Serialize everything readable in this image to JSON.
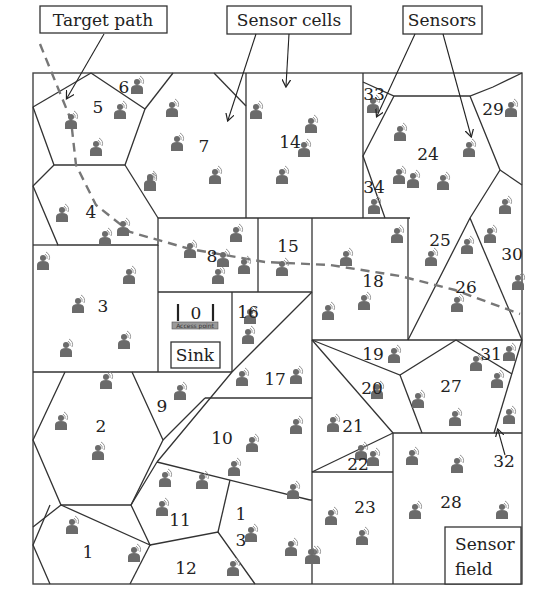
{
  "diagram": {
    "callouts": {
      "target_path": "Target path",
      "sensor_cells": "Sensor cells",
      "sensors": "Sensors",
      "sensor_field_line1": "Sensor",
      "sensor_field_line2": "field",
      "sink": "Sink",
      "access_point": "Access point"
    },
    "sink_cell_id": "0",
    "cell_labels": [
      {
        "id": "1",
        "x": 88,
        "y": 558
      },
      {
        "id": "2",
        "x": 101,
        "y": 432
      },
      {
        "id": "3",
        "x": 103,
        "y": 312
      },
      {
        "id": "4",
        "x": 91,
        "y": 218
      },
      {
        "id": "5",
        "x": 98,
        "y": 113
      },
      {
        "id": "6",
        "x": 124,
        "y": 93
      },
      {
        "id": "7",
        "x": 204,
        "y": 152
      },
      {
        "id": "8",
        "x": 212,
        "y": 262
      },
      {
        "id": "9",
        "x": 162,
        "y": 412
      },
      {
        "id": "10",
        "x": 222,
        "y": 444
      },
      {
        "id": "11",
        "x": 180,
        "y": 526
      },
      {
        "id": "12",
        "x": 186,
        "y": 574
      },
      {
        "id": "1",
        "x": 241,
        "y": 520
      },
      {
        "id": "3",
        "x": 241,
        "y": 546
      },
      {
        "id": "14",
        "x": 290,
        "y": 148
      },
      {
        "id": "15",
        "x": 288,
        "y": 252
      },
      {
        "id": "16",
        "x": 248,
        "y": 318
      },
      {
        "id": "17",
        "x": 275,
        "y": 385
      },
      {
        "id": "18",
        "x": 373,
        "y": 287
      },
      {
        "id": "19",
        "x": 373,
        "y": 360
      },
      {
        "id": "20",
        "x": 372,
        "y": 394
      },
      {
        "id": "21",
        "x": 353,
        "y": 432
      },
      {
        "id": "22",
        "x": 358,
        "y": 470
      },
      {
        "id": "23",
        "x": 365,
        "y": 513
      },
      {
        "id": "24",
        "x": 428,
        "y": 160
      },
      {
        "id": "25",
        "x": 440,
        "y": 246
      },
      {
        "id": "26",
        "x": 466,
        "y": 293
      },
      {
        "id": "27",
        "x": 451,
        "y": 392
      },
      {
        "id": "28",
        "x": 451,
        "y": 508
      },
      {
        "id": "29",
        "x": 493,
        "y": 115
      },
      {
        "id": "30",
        "x": 512,
        "y": 260
      },
      {
        "id": "31",
        "x": 491,
        "y": 360
      },
      {
        "id": "32",
        "x": 504,
        "y": 467
      },
      {
        "id": "33",
        "x": 374,
        "y": 100
      },
      {
        "id": "34",
        "x": 374,
        "y": 193
      }
    ],
    "sensors": [
      [
        137,
        86
      ],
      [
        71,
        121
      ],
      [
        120,
        111
      ],
      [
        96,
        148
      ],
      [
        172,
        109
      ],
      [
        177,
        143
      ],
      [
        150,
        181
      ],
      [
        215,
        176
      ],
      [
        150,
        183
      ],
      [
        62,
        214
      ],
      [
        123,
        228
      ],
      [
        105,
        238
      ],
      [
        43,
        262
      ],
      [
        129,
        276
      ],
      [
        78,
        305
      ],
      [
        66,
        349
      ],
      [
        124,
        341
      ],
      [
        190,
        250
      ],
      [
        236,
        234
      ],
      [
        244,
        266
      ],
      [
        218,
        276
      ],
      [
        256,
        111
      ],
      [
        311,
        125
      ],
      [
        304,
        149
      ],
      [
        282,
        176
      ],
      [
        282,
        268
      ],
      [
        223,
        259
      ],
      [
        250,
        316
      ],
      [
        248,
        336
      ],
      [
        242,
        378
      ],
      [
        296,
        376
      ],
      [
        106,
        381
      ],
      [
        180,
        392
      ],
      [
        61,
        422
      ],
      [
        98,
        452
      ],
      [
        252,
        444
      ],
      [
        296,
        426
      ],
      [
        234,
        468
      ],
      [
        165,
        479
      ],
      [
        202,
        481
      ],
      [
        293,
        491
      ],
      [
        162,
        508
      ],
      [
        72,
        526
      ],
      [
        134,
        554
      ],
      [
        233,
        568
      ],
      [
        251,
        534
      ],
      [
        291,
        548
      ],
      [
        314,
        556
      ],
      [
        373,
        105
      ],
      [
        374,
        206
      ],
      [
        400,
        133
      ],
      [
        469,
        149
      ],
      [
        399,
        176
      ],
      [
        413,
        180
      ],
      [
        443,
        182
      ],
      [
        511,
        109
      ],
      [
        505,
        206
      ],
      [
        490,
        235
      ],
      [
        467,
        246
      ],
      [
        431,
        258
      ],
      [
        518,
        282
      ],
      [
        457,
        304
      ],
      [
        346,
        258
      ],
      [
        397,
        235
      ],
      [
        328,
        312
      ],
      [
        364,
        302
      ],
      [
        394,
        355
      ],
      [
        377,
        391
      ],
      [
        418,
        400
      ],
      [
        509,
        353
      ],
      [
        476,
        363
      ],
      [
        497,
        380
      ],
      [
        455,
        418
      ],
      [
        509,
        416
      ],
      [
        333,
        424
      ],
      [
        361,
        452
      ],
      [
        373,
        458
      ],
      [
        331,
        517
      ],
      [
        362,
        537
      ],
      [
        412,
        457
      ],
      [
        457,
        465
      ],
      [
        502,
        511
      ],
      [
        415,
        511
      ],
      [
        311,
        556
      ]
    ],
    "target_path_points": [
      [
        40,
        44
      ],
      [
        71,
        120
      ],
      [
        96,
        205
      ],
      [
        130,
        235
      ],
      [
        190,
        249
      ],
      [
        265,
        265
      ],
      [
        330,
        265
      ],
      [
        400,
        276
      ],
      [
        455,
        290
      ],
      [
        520,
        314
      ]
    ],
    "colors": {
      "edge": "#333333",
      "sensor": "#6b6b6b",
      "target_path": "#7a7a7a",
      "background": "#ffffff"
    }
  }
}
